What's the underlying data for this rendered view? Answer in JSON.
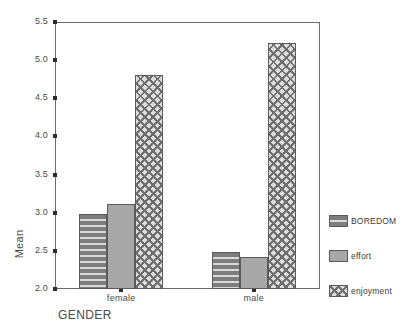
{
  "chart_data": {
    "type": "bar",
    "title": "",
    "subtitle": "",
    "xlabel": "GENDER",
    "ylabel": "Mean",
    "categories": [
      "female",
      "male"
    ],
    "series": [
      {
        "name": "BOREDOM",
        "values": [
          2.98,
          2.48
        ],
        "pattern": "horizontal-stripes",
        "color": "#8b8b8b"
      },
      {
        "name": "effort",
        "values": [
          3.12,
          2.42
        ],
        "pattern": "solid",
        "color": "#a8a8a8"
      },
      {
        "name": "enjoyment",
        "values": [
          4.8,
          5.22
        ],
        "pattern": "crosshatch",
        "color": "#8f8f8f"
      }
    ],
    "ylim": [
      2.0,
      5.5
    ],
    "ytick_labels": [
      "5.5",
      "5.0",
      "4.5",
      "4.0",
      "3.5",
      "3.0",
      "2.5",
      "2.0"
    ],
    "ytick_values": [
      5.5,
      5.0,
      4.5,
      4.0,
      3.5,
      3.0,
      2.5,
      2.0
    ],
    "grid": false,
    "legend_position": "right",
    "frame": true
  },
  "axes": {
    "y_title": "Mean",
    "x_title": "GENDER"
  },
  "legend": {
    "items": [
      {
        "label": "BOREDOM"
      },
      {
        "label": "effort"
      },
      {
        "label": "enjoyment"
      }
    ]
  },
  "colors": {
    "axis": "#6b6b6b",
    "tick": "#2c2c2c",
    "text": "#4a4a4a",
    "bar_boredom": "#8b8b8b",
    "bar_effort": "#a8a8a8",
    "bar_enjoyment": "#8f8f8f",
    "background": "#ffffff"
  }
}
